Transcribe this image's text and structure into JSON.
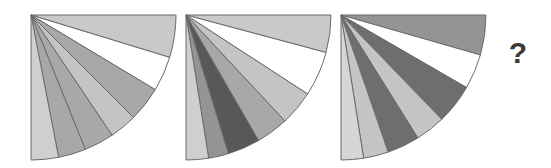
{
  "puzzle": {
    "type": "visual-sequence-analogy",
    "background_color": "#ffffff",
    "answer_placeholder": "?",
    "palette": {
      "white": "#ffffff",
      "very_light_gray": "#d6d6d6",
      "light_gray": "#c9c9c9",
      "medium_gray": "#a8a8a8",
      "mid_dark_gray": "#949494",
      "dark_gray": "#6e6e6e",
      "darkest_gray": "#585858",
      "outline": "#6b6b6b",
      "question_color": "#3a3a3a"
    },
    "figures": [
      {
        "id": "figure-1",
        "label": "Figure 1",
        "x": 30,
        "y": 14,
        "radius": 145,
        "start_angle": 0,
        "end_angle": 90,
        "wedge_count": 7,
        "wedges": [
          {
            "index": 1,
            "start": 0,
            "end": 17,
            "fill": "#c9c9c9",
            "shade_name": "light-gray"
          },
          {
            "index": 2,
            "start": 17,
            "end": 31,
            "fill": "#ffffff",
            "shade_name": "white"
          },
          {
            "index": 3,
            "start": 31,
            "end": 45,
            "fill": "#a8a8a8",
            "shade_name": "medium-gray"
          },
          {
            "index": 4,
            "start": 45,
            "end": 56,
            "fill": "#c4c4c4",
            "shade_name": "light-gray"
          },
          {
            "index": 5,
            "start": 56,
            "end": 68,
            "fill": "#a8a8a8",
            "shade_name": "medium-gray"
          },
          {
            "index": 6,
            "start": 68,
            "end": 79,
            "fill": "#a8a8a8",
            "shade_name": "medium-gray"
          },
          {
            "index": 7,
            "start": 79,
            "end": 90,
            "fill": "#cfcfcf",
            "shade_name": "very-light-gray"
          }
        ]
      },
      {
        "id": "figure-2",
        "label": "Figure 2",
        "x": 185,
        "y": 14,
        "radius": 145,
        "start_angle": 0,
        "end_angle": 90,
        "wedge_count": 7,
        "wedges": [
          {
            "index": 1,
            "start": 0,
            "end": 15,
            "fill": "#c9c9c9",
            "shade_name": "light-gray"
          },
          {
            "index": 2,
            "start": 15,
            "end": 33,
            "fill": "#ffffff",
            "shade_name": "white"
          },
          {
            "index": 3,
            "start": 33,
            "end": 47,
            "fill": "#c4c4c4",
            "shade_name": "light-gray"
          },
          {
            "index": 4,
            "start": 47,
            "end": 60,
            "fill": "#a8a8a8",
            "shade_name": "medium-gray"
          },
          {
            "index": 5,
            "start": 60,
            "end": 73,
            "fill": "#585858",
            "shade_name": "darkest-gray"
          },
          {
            "index": 6,
            "start": 73,
            "end": 81,
            "fill": "#949494",
            "shade_name": "mid-dark-gray"
          },
          {
            "index": 7,
            "start": 81,
            "end": 90,
            "fill": "#cfcfcf",
            "shade_name": "very-light-gray"
          }
        ]
      },
      {
        "id": "figure-3",
        "label": "Figure 3",
        "x": 340,
        "y": 14,
        "radius": 145,
        "start_angle": 0,
        "end_angle": 90,
        "wedge_count": 7,
        "wedges": [
          {
            "index": 1,
            "start": 0,
            "end": 16,
            "fill": "#949494",
            "shade_name": "mid-dark-gray"
          },
          {
            "index": 2,
            "start": 16,
            "end": 30,
            "fill": "#ffffff",
            "shade_name": "white"
          },
          {
            "index": 3,
            "start": 30,
            "end": 46,
            "fill": "#6e6e6e",
            "shade_name": "dark-gray"
          },
          {
            "index": 4,
            "start": 46,
            "end": 58,
            "fill": "#c4c4c4",
            "shade_name": "light-gray"
          },
          {
            "index": 5,
            "start": 58,
            "end": 71,
            "fill": "#6e6e6e",
            "shade_name": "dark-gray"
          },
          {
            "index": 6,
            "start": 71,
            "end": 81,
            "fill": "#c4c4c4",
            "shade_name": "light-gray"
          },
          {
            "index": 7,
            "start": 81,
            "end": 90,
            "fill": "#d6d6d6",
            "shade_name": "very-light-gray"
          }
        ]
      }
    ],
    "question": {
      "id": "figure-4-unknown",
      "label": "?",
      "x": 498,
      "y": 30,
      "width": 40,
      "height": 45
    }
  }
}
